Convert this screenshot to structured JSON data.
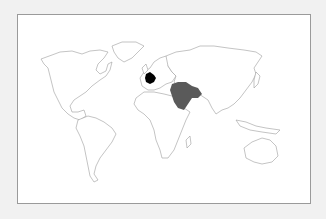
{
  "map": {
    "type": "world-outline",
    "highlighted_regions": [
      {
        "name": "France",
        "color": "#000000"
      },
      {
        "name": "Middle East",
        "color": "#5a5a5a"
      }
    ],
    "land_fill": "#ffffff",
    "outline_color": "#9c9c9c",
    "frame_border": "#9a9a9a",
    "background": "#f1f1f1"
  }
}
